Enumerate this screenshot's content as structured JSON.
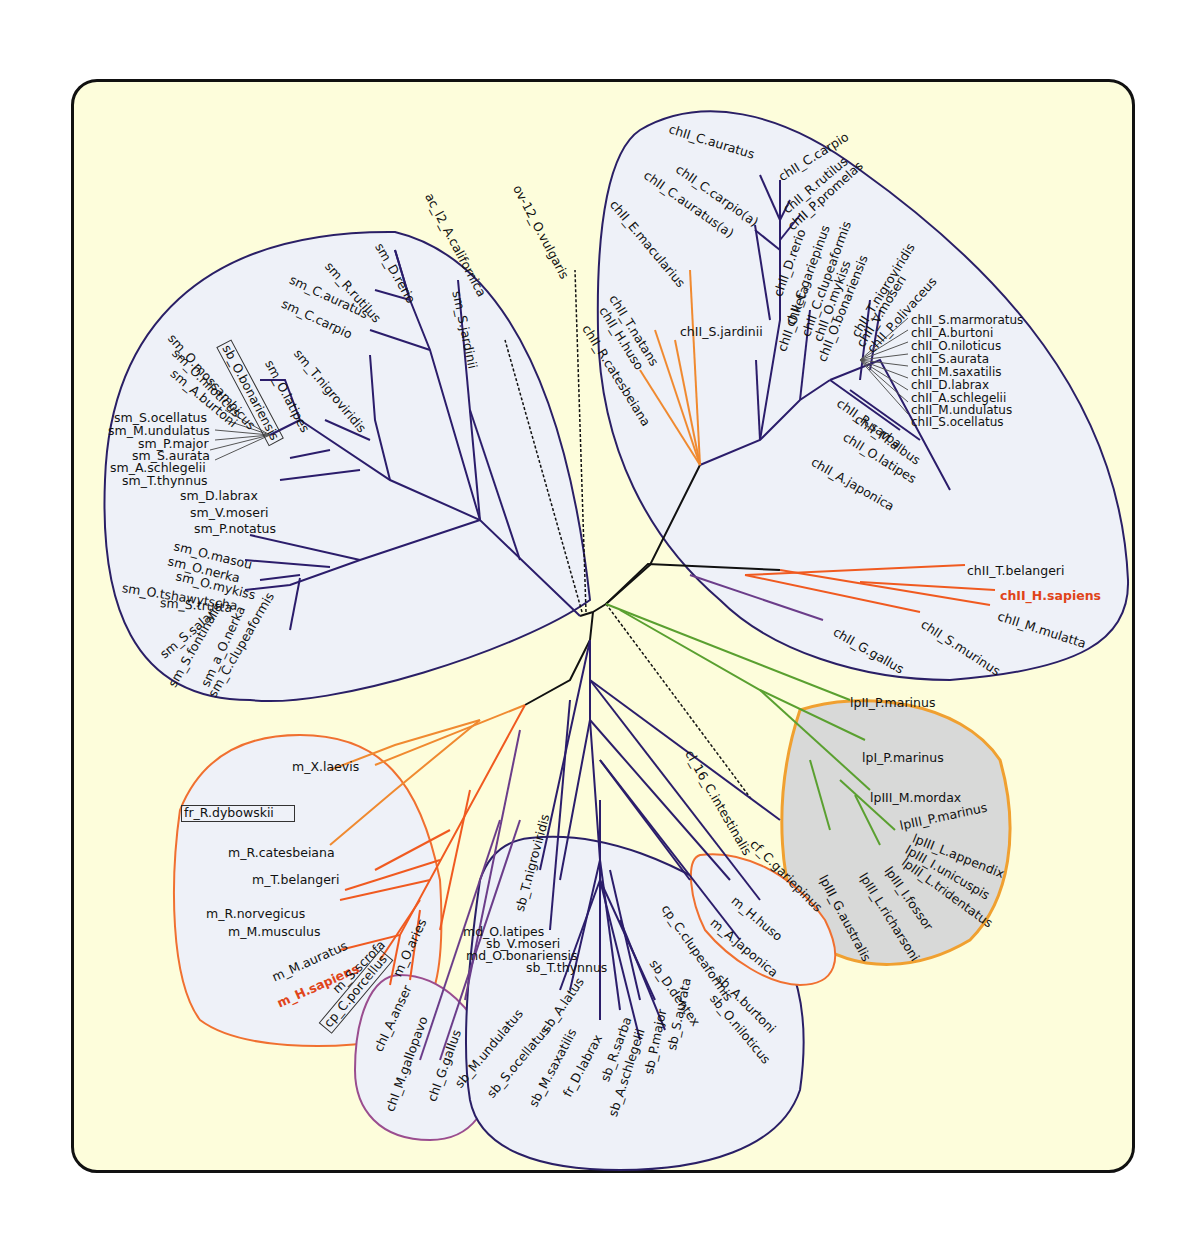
{
  "figure": {
    "type": "unrooted phylogenetic tree",
    "colors": {
      "background": "#fdfddb",
      "panel_border": "#111111",
      "clade_fill": "#eef1f8",
      "clade_outline_navy": "#2a1f66",
      "clade_outline_orange": "#f07030",
      "clade_outline_purple": "#9a4d8f",
      "clade_outline_gold": "#f0a030",
      "gray_clade_fill": "#d8d9d8",
      "branch_navy": "#2b1d6b",
      "branch_orange": "#f08a30",
      "branch_redorange": "#f05a20",
      "branch_green": "#5aa030",
      "branch_purple": "#6b3d8a",
      "branch_black": "#111111",
      "highlight_text": "#e0441a"
    }
  },
  "clades": {
    "sm": {
      "name": "sm clade (upper left)",
      "labels": [
        "sm_D.rerio",
        "sm_R.rutilus",
        "sm_C.auratus",
        "sm_C.carpio",
        "sm_T.nigroviridis",
        "sm_O.latipes",
        "sb_O.bonariensis",
        "sm_O.mossambicus",
        "sm_O.niloticus",
        "sm_A.burtoni",
        "sm_S.ocellatus",
        "sm_M.undulatus",
        "sm_P.major",
        "sm_S.aurata",
        "sm_A.schlegelii",
        "sm_T.thynnus",
        "sm_D.labrax",
        "sm_V.moseri",
        "sm_P.notatus",
        "sm_O.masou",
        "sm_O.nerka",
        "sm_O.mykiss",
        "sm_O.tshawytscha",
        "sm_S.trutta",
        "sm_S.salar",
        "sm_S.fontinalis",
        "sm_a_O.nerka",
        "sm_C.clupeaformis",
        "sm_S.jardinii"
      ]
    },
    "outgroups": {
      "labels": [
        "ac_l2_A.californica",
        "ov-12_O.vulgaris",
        "cl_16_C.intestinalis",
        "cf_C.gariepinus",
        "lpII_P.marinus"
      ]
    },
    "chII": {
      "name": "chII clade (upper right)",
      "labels": [
        "chII_C.auratus",
        "chII_C.carpio",
        "chII_C.carpio(a)",
        "chII_R.rutilus",
        "chII_C.auratus(a)",
        "chII_P.promelas",
        "chII_E.macularius",
        "chII_D.rerio",
        "chII_C.gariepinus",
        "chII_O.keta",
        "chII_C.clupeaformis",
        "chII_O.mykiss",
        "chII_O.bonariensis",
        "chII_T.nigroviridis",
        "chII_V.moseri",
        "chII_P.olivaceus",
        "chII_S.jardinii",
        "chII_T.natans",
        "chII_H.huso",
        "chII_R.catesbeiana",
        "chII_S.marmoratus",
        "chII_A.burtoni",
        "chII_O.niloticus",
        "chII_S.aurata",
        "chII_M.saxatilis",
        "chII_D.labrax",
        "chII_A.schlegelii",
        "chII_M.undulatus",
        "chII_S.ocellatus",
        "chII_R.sarba",
        "chII_M.albus",
        "chII_O.latipes",
        "chII_A.japonica",
        "chII_T.belangeri",
        "chII_H.sapiens",
        "chII_M.mulatta",
        "chII_S.murinus",
        "chII_G.gallus"
      ]
    },
    "lp": {
      "name": "lamprey clade (gray)",
      "labels": [
        "lpI_P.marinus",
        "lpIII_M.mordax",
        "lpIII_P.marinus",
        "lpIII_L.appendix",
        "lpIII_I.unicuspis",
        "lpIII_L.tridentatus",
        "lpIII_I.fossor",
        "lpIII_L.richarsoni",
        "lpIII_G.australis"
      ]
    },
    "m": {
      "name": "m clade (lower left)",
      "labels": [
        "m_X.laevis",
        "fr_R.dybowskii",
        "m_R.catesbeiana",
        "m_T.belangeri",
        "m_R.norvegicus",
        "m_M.musculus",
        "m_M.auratus",
        "m_H.sapiens",
        "m_S.scrofa",
        "cp_C.porcellus",
        "m_O.aries"
      ]
    },
    "chI": {
      "name": "chI bird clade",
      "labels": [
        "chI_A.anser",
        "chI_M.gallopavo",
        "chI_G.gallus"
      ]
    },
    "sb": {
      "name": "sb clade (bottom)",
      "labels": [
        "sb_T.nigroviridis",
        "md_O.latipes",
        "sb_V.moseri",
        "md_O.bonariensis",
        "sb_T.thynnus",
        "sb_M.undulatus",
        "sb_S.ocellatus",
        "sb_A.latus",
        "sb_M.saxatilis",
        "fr_D.labrax",
        "sb_R.sarba",
        "sb_A.schlegelii",
        "sb_P.major",
        "sb_S.aurata",
        "sb_D.dentex",
        "sb_O.niloticus",
        "sb_A.burtoni",
        "cp_C.clupeaformis"
      ]
    },
    "mh": {
      "name": "small orange clade",
      "labels": [
        "m_H.huso",
        "m_A.japonica"
      ]
    }
  }
}
